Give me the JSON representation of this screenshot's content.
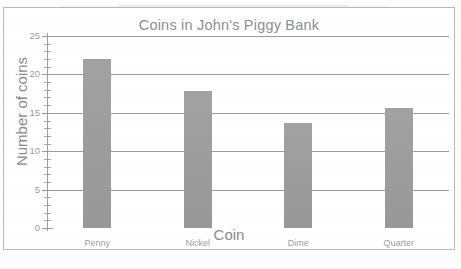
{
  "chart_data": {
    "type": "bar",
    "title": "Coins in John's Piggy Bank",
    "xlabel": "Coin",
    "ylabel": "Number of coins",
    "categories": [
      "Penny",
      "Nickel",
      "Dime",
      "Quarter"
    ],
    "values": [
      22,
      17.8,
      13.7,
      15.6
    ],
    "ylim": [
      0,
      25
    ],
    "ytick_labels": [
      "0",
      "5",
      "10",
      "15",
      "20",
      "25"
    ],
    "ytick_values": [
      0,
      5,
      10,
      15,
      20,
      25
    ],
    "minor_tick_step": 1,
    "grid": "horizontal",
    "legend": "none",
    "bar_color": "#9d9d9d",
    "text_color": "#8e8e8e",
    "gridline_color": "#9a9a9a",
    "frame_color": "#b9b9b9",
    "background": "#ffffff"
  }
}
